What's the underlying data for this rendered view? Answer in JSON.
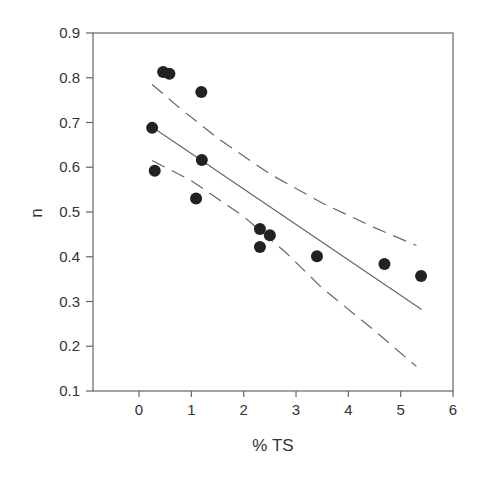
{
  "chart_data": {
    "type": "scatter",
    "title": "",
    "xlabel": "% TS",
    "ylabel": "n",
    "xlim": [
      -0.88,
      6
    ],
    "ylim": [
      0.1,
      0.9
    ],
    "xticks": [
      0,
      1,
      2,
      3,
      4,
      5,
      6
    ],
    "yticks": [
      0.1,
      0.2,
      0.3,
      0.4,
      0.5,
      0.6,
      0.7,
      0.8,
      0.9
    ],
    "xtick_labels": [
      "0",
      "1",
      "2",
      "3",
      "4",
      "5",
      "6"
    ],
    "ytick_labels": [
      "0.1",
      "0.2",
      "0.3",
      "0.4",
      "0.5",
      "0.6",
      "0.7",
      "0.8",
      "0.9"
    ],
    "grid": false,
    "legend": null,
    "points": [
      {
        "x": 0.46,
        "y": 0.813
      },
      {
        "x": 0.58,
        "y": 0.809
      },
      {
        "x": 1.19,
        "y": 0.768
      },
      {
        "x": 0.25,
        "y": 0.688
      },
      {
        "x": 1.2,
        "y": 0.616
      },
      {
        "x": 0.3,
        "y": 0.592
      },
      {
        "x": 1.09,
        "y": 0.53
      },
      {
        "x": 2.31,
        "y": 0.462
      },
      {
        "x": 2.5,
        "y": 0.448
      },
      {
        "x": 2.31,
        "y": 0.422
      },
      {
        "x": 3.4,
        "y": 0.401
      },
      {
        "x": 4.69,
        "y": 0.384
      },
      {
        "x": 5.39,
        "y": 0.357
      }
    ],
    "regression_line": {
      "x": [
        0.25,
        5.4
      ],
      "y": [
        0.69,
        0.282
      ],
      "style": "solid"
    },
    "confidence_upper": {
      "x": [
        0.25,
        0.8,
        1.5,
        2.5,
        3.5,
        4.5,
        5.3
      ],
      "y": [
        0.785,
        0.73,
        0.665,
        0.585,
        0.52,
        0.465,
        0.425
      ],
      "style": "dashed"
    },
    "confidence_lower": {
      "x": [
        0.25,
        1.0,
        2.0,
        2.8,
        3.5,
        4.5,
        5.3
      ],
      "y": [
        0.615,
        0.57,
        0.49,
        0.41,
        0.33,
        0.235,
        0.155
      ],
      "style": "dashed"
    },
    "colors": {
      "points": "#222222",
      "lines": "#666666",
      "axes": "#555555"
    }
  }
}
